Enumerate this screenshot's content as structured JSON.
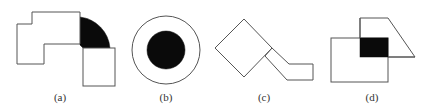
{
  "figure": {
    "panels": [
      {
        "id": "a",
        "label": "(a)",
        "description": "two polygons joined by a black quarter-ring arc"
      },
      {
        "id": "b",
        "label": "(b)",
        "description": "black disk inside a larger outlined circle"
      },
      {
        "id": "c",
        "label": "(c)",
        "description": "rotated square attached to a bent arm polygon"
      },
      {
        "id": "d",
        "label": "(d)",
        "description": "rectangle overlapping a trapezoid with black intersection region"
      }
    ],
    "colors": {
      "outline": "#555555",
      "fill": "#0a0a0a",
      "background": "#ffffff"
    }
  }
}
